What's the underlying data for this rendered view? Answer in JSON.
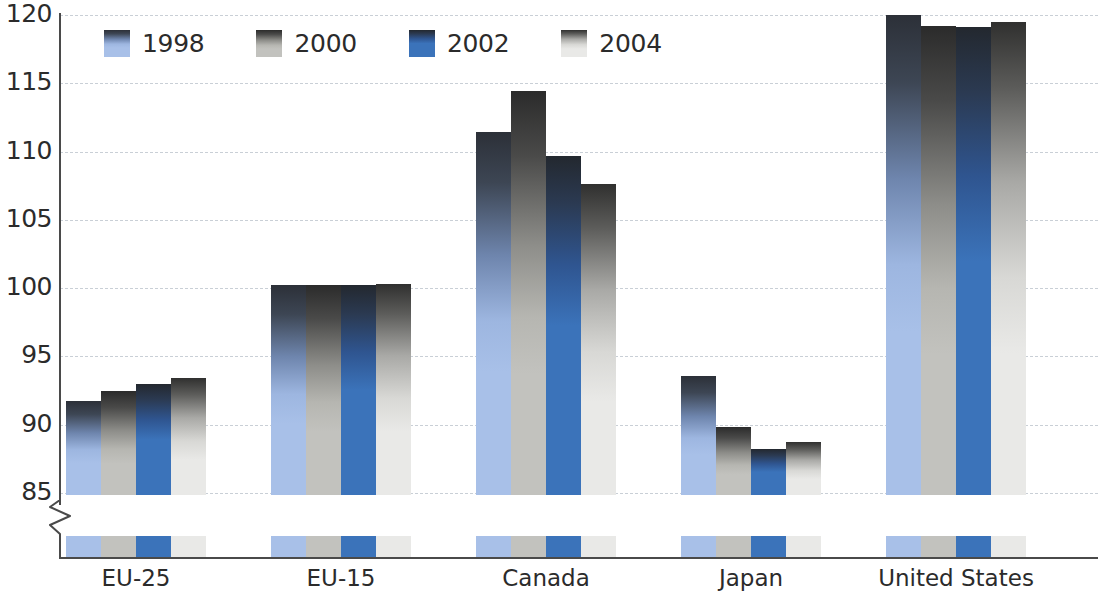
{
  "chart_data": {
    "type": "bar",
    "title": "",
    "subtitle": "",
    "xlabel": "",
    "ylabel": "",
    "categories": [
      "EU-25",
      "EU-15",
      "Canada",
      "Japan",
      "United States"
    ],
    "series": [
      {
        "name": "1998",
        "color": "#a8c0e8",
        "values": [
          91.7,
          100.2,
          111.4,
          93.6,
          120.0
        ]
      },
      {
        "name": "2000",
        "color": "#c2c2be",
        "values": [
          92.5,
          100.2,
          114.4,
          89.8,
          119.2
        ]
      },
      {
        "name": "2002",
        "color": "#3b73ba",
        "values": [
          93.0,
          100.2,
          109.7,
          88.2,
          119.1
        ]
      },
      {
        "name": "2004",
        "color": "#e9e9e7",
        "values": [
          93.4,
          100.3,
          107.6,
          88.7,
          119.5
        ]
      }
    ],
    "ylim": [
      85,
      120
    ],
    "yticks": [
      85,
      90,
      95,
      100,
      105,
      110,
      115,
      120
    ],
    "ytick_labels": [
      "85",
      "90",
      "95",
      "100",
      "105",
      "110",
      "115",
      "120"
    ],
    "axis_break": true,
    "axis_break_note": "y-axis broken below 85",
    "grid": true,
    "grid_style": "dashed",
    "grid_color": "#c9cfd6",
    "legend_position": "top-left",
    "axis_color": "#4a4a4a",
    "background": "#ffffff",
    "bar_gradient": "dark top fading to series color"
  },
  "legend": {
    "items": [
      {
        "label": "1998",
        "swatch": "legend-swatch-1998"
      },
      {
        "label": "2000",
        "swatch": "legend-swatch-2000"
      },
      {
        "label": "2002",
        "swatch": "legend-swatch-2002"
      },
      {
        "label": "2004",
        "swatch": "legend-swatch-2004"
      }
    ]
  }
}
